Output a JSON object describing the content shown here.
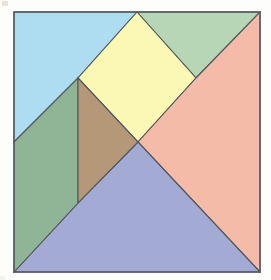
{
  "figure": {
    "canvas": {
      "width": 271,
      "height": 280,
      "background": "#fdfdfb"
    },
    "stroke_color": "#54585e",
    "square_frame": {
      "label": "outer-square",
      "top_left": [
        14,
        12
      ],
      "top_right": [
        260,
        12
      ],
      "bottom_right": [
        260,
        272
      ],
      "bottom_left": [
        14,
        272
      ],
      "width": 246,
      "height": 260
    },
    "key_points": {
      "top_edge_node": [
        137,
        12
      ],
      "left_edge_midpoint": [
        14,
        142
      ],
      "diamond_left": [
        78,
        78
      ],
      "diamond_right": [
        196,
        78
      ],
      "center": [
        138,
        142
      ],
      "lower_vertical_node": [
        78,
        203
      ]
    },
    "pieces": [
      {
        "name": "light-blue-triangle",
        "label": "Light blue triangle",
        "color": "#aedcf0",
        "points": "14,12 137,12 78,78 14,142"
      },
      {
        "name": "light-green-triangle",
        "label": "Light green triangle",
        "color": "#b6d6b6",
        "points": "137,12 260,12 196,78"
      },
      {
        "name": "yellow-square",
        "label": "Yellow tilted square",
        "color": "#fbf7b5",
        "points": "137,12 196,78 138,142 78,78"
      },
      {
        "name": "salmon-triangle",
        "label": "Salmon triangle",
        "color": "#f4bca8",
        "points": "260,12 260,272 138,142 196,78"
      },
      {
        "name": "periwinkle-triangle",
        "label": "Periwinkle blue triangle",
        "color": "#a3aad4",
        "points": "138,142 260,272 14,272 78,203"
      },
      {
        "name": "green-parallelogram",
        "label": "Green parallelogram",
        "color": "#8fb496",
        "points": "14,142 78,78 78,203 14,272"
      },
      {
        "name": "brown-triangle",
        "label": "Brown triangle",
        "color": "#b59878",
        "points": "78,78 138,142 78,203"
      }
    ]
  }
}
